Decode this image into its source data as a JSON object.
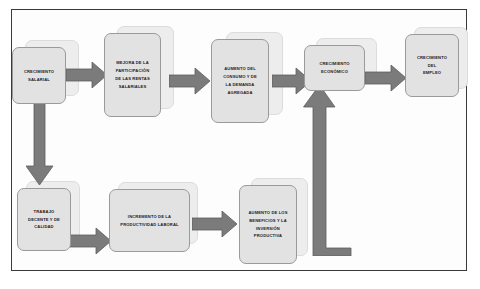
{
  "diagram": {
    "background_color": "#ffffff",
    "frame_color": "#3a3a3a",
    "node_fill": "#e2e2e2",
    "node_border": "#9a9a9a",
    "arrow_fill": "#7b7b7b",
    "arrow_border": "#5e5e5e"
  },
  "nodes": [
    {
      "id": "crecimiento-salarial",
      "lines": [
        "CRECIMIENTO",
        "SALARIAL"
      ]
    },
    {
      "id": "mejora-participacion-rentas-salariales",
      "lines": [
        "MEJORA DE LA",
        "PARTICIPACIÓN",
        "DE LAS RENTAS",
        "SALARIALES"
      ]
    },
    {
      "id": "aumento-consumo-demanda-agregada",
      "lines": [
        "AUMENTO DEL",
        "CONSUMO Y DE",
        "LA DEMANDA",
        "AGREGADA"
      ]
    },
    {
      "id": "crecimiento-economico",
      "lines": [
        "CRECIMIENTO",
        "ECONÓMICO"
      ]
    },
    {
      "id": "crecimiento-del-empleo",
      "lines": [
        "CRECIMIENTO",
        "DEL",
        "EMPLEO"
      ]
    },
    {
      "id": "trabajo-decente-y-de-calidad",
      "lines": [
        "TRABAJO",
        "DECENTE Y DE",
        "CALIDAD"
      ]
    },
    {
      "id": "incremento-productividad-laboral",
      "lines": [
        "INCREMENTO DE LA",
        "PRODUCTIVIDAD LABORAL"
      ]
    },
    {
      "id": "aumento-beneficios-inversion-productiva",
      "lines": [
        "AUMENTO DE LOS",
        "BENEFICIOS Y LA",
        "INVERSIÓN",
        "PRODUCTIVA"
      ]
    }
  ],
  "connectors": [
    {
      "id": "arrow-salarial-to-mejora",
      "direction": "right"
    },
    {
      "id": "arrow-mejora-to-consumo",
      "direction": "right"
    },
    {
      "id": "arrow-consumo-to-crecimiento",
      "direction": "right"
    },
    {
      "id": "arrow-crecimiento-to-empleo",
      "direction": "right"
    },
    {
      "id": "arrow-salarial-to-trabajo",
      "direction": "down"
    },
    {
      "id": "arrow-trabajo-to-productividad",
      "direction": "right"
    },
    {
      "id": "arrow-productividad-to-beneficios",
      "direction": "right"
    },
    {
      "id": "arrow-beneficios-to-crecimiento",
      "direction": "elbow-right-up"
    }
  ]
}
